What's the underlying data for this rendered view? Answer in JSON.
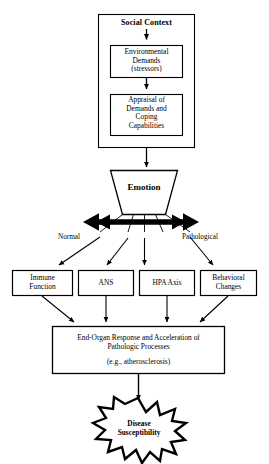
{
  "diagram": {
    "width": 269,
    "height": 464,
    "stroke_color": "#000000",
    "fill_color": "#ffffff",
    "background": "#ffffff"
  },
  "outer_container": {
    "label": "Social Context"
  },
  "boxes": {
    "environmental_demands": "Environmental\nDemands\n(stressors)",
    "appraisal": "Appraisal of\nDemands and\nCoping\nCapabilities",
    "emotion": "Emotion",
    "end_organ": "End-Organ Response and Acceleration  of\nPathologic Processes",
    "end_organ_example": "(e.g., atherosclerosis)"
  },
  "axis_labels": {
    "left": "Normal",
    "right": "Pathological"
  },
  "mediators": [
    {
      "id": "immune-function",
      "label": "Immune\nFunction"
    },
    {
      "id": "ans",
      "label": "ANS"
    },
    {
      "id": "hpa-axis",
      "label": "HPA Axis"
    },
    {
      "id": "behavioral-changes",
      "label": "Behavioral\nChanges"
    }
  ],
  "outcome": {
    "label": "Disease\nSusceptibility"
  }
}
